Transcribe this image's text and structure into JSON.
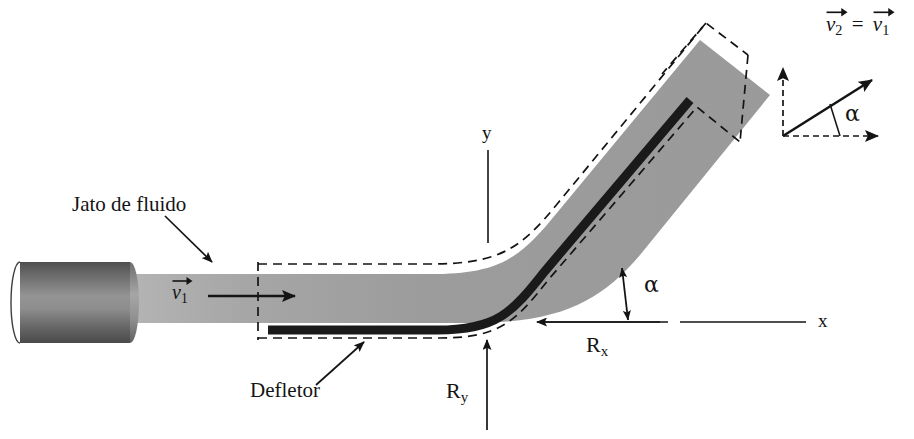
{
  "figure": {
    "type": "engineering-diagram",
    "language": "pt-BR"
  },
  "labels": {
    "jet_label": "Jato de fluido",
    "deflector_label": "Defletor",
    "velocity_in": "v",
    "velocity_in_sub": "1",
    "velocity_out_equation_left": "v",
    "velocity_out_equation_left_sub": "2",
    "velocity_out_equation_eq": "=",
    "velocity_out_equation_right": "v",
    "velocity_out_equation_right_sub": "1",
    "axis_x": "x",
    "axis_y": "y",
    "force_x": "R",
    "force_x_sub": "x",
    "force_y": "R",
    "force_y_sub": "y",
    "angle_deflector": "α",
    "angle_vector_diagram": "α"
  },
  "colors": {
    "jet_gray": "#9b9b9b",
    "jet_gray_light": "#b0b0b0",
    "nozzle_dark": "#5a5a5a",
    "nozzle_mid": "#8a8a8a",
    "deflector_black": "#1a1a1a",
    "line_black": "#141414",
    "background": "#ffffff"
  },
  "geometry": {
    "nozzle": {
      "x": 20,
      "y": 262,
      "width": 118,
      "height": 81
    },
    "jet_inlet_y_top": 274,
    "jet_inlet_y_bottom": 323,
    "control_volume_left_x": 258,
    "control_volume_top_y": 262,
    "control_volume_bottom_y": 340,
    "deflection_angle_degrees": 40,
    "x_axis_y": 322,
    "y_axis_x": 488
  }
}
